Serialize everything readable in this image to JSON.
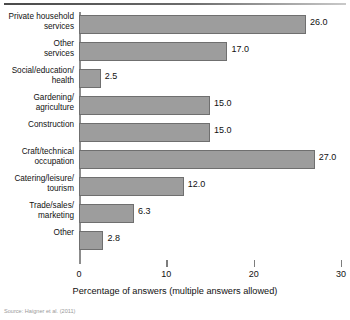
{
  "chart_data": {
    "type": "bar",
    "orientation": "horizontal",
    "title": "",
    "xlabel": "Percentage of answers (multiple answers allowed)",
    "ylabel": "",
    "xlim": [
      0,
      30
    ],
    "xticks": [
      0,
      10,
      20,
      30
    ],
    "xtick_labels": [
      "0",
      "10",
      "20",
      "30"
    ],
    "grid": false,
    "legend": null,
    "bar_color": "#9d9d9d",
    "bar_edge_color": "#6f6f6f",
    "categories": [
      "Private household\nservices",
      "Other\nservices",
      "Social/education/\nhealth",
      "Gardening/\nagriculture",
      "Construction",
      "Craft/technical\noccupation",
      "Catering/leisure/\ntourism",
      "Trade/sales/\nmarketing",
      "Other"
    ],
    "values": [
      26.0,
      17.0,
      2.5,
      15.0,
      15.0,
      27.0,
      12.0,
      6.3,
      2.8
    ],
    "value_labels": [
      "26.0",
      "17.0",
      "2.5",
      "15.0",
      "15.0",
      "27.0",
      "12.0",
      "6.3",
      "2.8"
    ]
  },
  "figure": {
    "source_note": "Source: Haigner et al. (2011)"
  }
}
